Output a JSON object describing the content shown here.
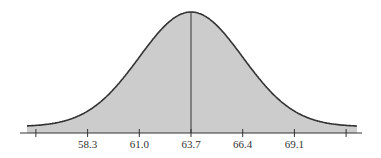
{
  "chart_data": {
    "type": "area",
    "title": "",
    "xlabel": "",
    "ylabel": "",
    "distribution": {
      "mean": 63.7,
      "std_dev": 2.7
    },
    "tick_values": [
      55.6,
      58.3,
      61.0,
      63.7,
      66.4,
      69.1,
      71.8
    ],
    "tick_labels": [
      "",
      "58.3",
      "61.0",
      "63.7",
      "66.4",
      "69.1",
      ""
    ],
    "xlim": [
      55.1,
      72.5
    ],
    "mean_line": 63.7,
    "grid": false,
    "legend": null,
    "colors": {
      "fill": "#cccccc",
      "curve": "#333333",
      "axis": "#333333"
    }
  }
}
